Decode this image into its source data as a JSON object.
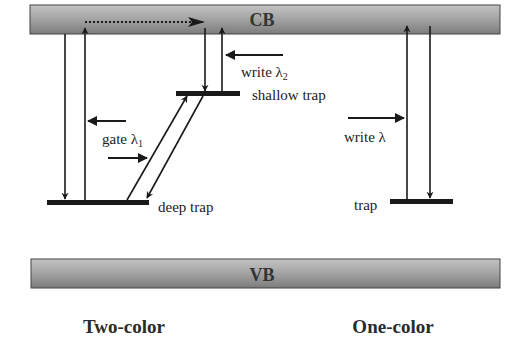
{
  "bands": {
    "conduction": {
      "label": "CB"
    },
    "valence": {
      "label": "VB"
    }
  },
  "two_color": {
    "title": "Two-color",
    "deep_trap_label": "deep trap",
    "shallow_trap_label": "shallow trap",
    "gate_label": "gate λ",
    "gate_subscript": "1",
    "write_label": "write λ",
    "write_subscript": "2"
  },
  "one_color": {
    "title": "One-color",
    "trap_label": "trap",
    "write_label": "write λ"
  },
  "colors": {
    "band_fill_light": "#b8b8b8",
    "band_fill_dark": "#7a7a7a",
    "line": "#1a1a1a"
  }
}
